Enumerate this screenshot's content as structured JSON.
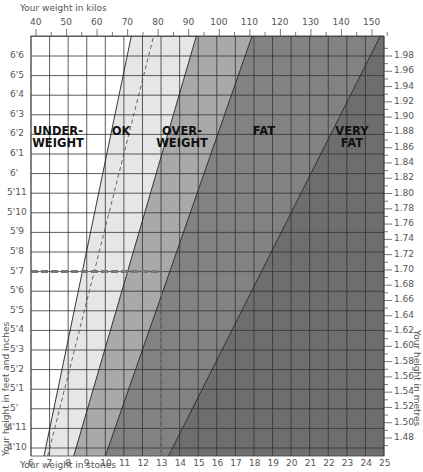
{
  "chart_data": {
    "type": "area",
    "top_axis_label": "Your weight in kilos",
    "bottom_axis_label": "Your weight in stones",
    "left_axis_label": "Your height in feet and inches",
    "right_axis_label": "Your height in metres",
    "kilo_ticks": [
      "40",
      "50",
      "60",
      "70",
      "80",
      "90",
      "100",
      "110",
      "120",
      "130",
      "140",
      "150"
    ],
    "stone_ticks": [
      "6",
      "7",
      "8",
      "9",
      "10",
      "11",
      "12",
      "13",
      "14",
      "15",
      "16",
      "17",
      "18",
      "19",
      "20",
      "21",
      "22",
      "23",
      "24",
      "25"
    ],
    "feet_inch_ticks": [
      "6'6",
      "6'5",
      "6'4",
      "6'3",
      "6'2",
      "6'1",
      "6'",
      "5'11",
      "5'10",
      "5'9",
      "5'8",
      "5'7",
      "5'6",
      "5'5",
      "5'4",
      "5'3",
      "5'2",
      "5'1",
      "5'",
      "4'11",
      "4'10"
    ],
    "metre_ticks": [
      "1.98",
      "1.96",
      "1.94",
      "1.92",
      "1.90",
      "1.88",
      "1.86",
      "1.84",
      "1.82",
      "1.80",
      "1.78",
      "1.76",
      "1.74",
      "1.72",
      "1.70",
      "1.68",
      "1.66",
      "1.64",
      "1.62",
      "1.60",
      "1.58",
      "1.56",
      "1.54",
      "1.52",
      "1.50",
      "1.48"
    ],
    "x_range_stones": [
      6,
      25
    ],
    "y_range_height": [
      "4'10",
      "6'7"
    ],
    "grid": true,
    "bands": [
      {
        "name": "UNDER-WEIGHT",
        "label_lines": [
          "UNDER-",
          "WEIGHT"
        ],
        "color": "#ffffff",
        "boundary_stones_at_4ft10": 6.7,
        "boundary_stones_at_top": 11.4
      },
      {
        "name": "OK",
        "label_lines": [
          "OK"
        ],
        "color": "#e6e6e6",
        "boundary_stones_at_4ft10": 8.3,
        "boundary_stones_at_top": 14.9
      },
      {
        "name": "OVER-WEIGHT",
        "label_lines": [
          "OVER-",
          "WEIGHT"
        ],
        "color": "#a9a9a9",
        "boundary_stones_at_4ft10": 10.0,
        "boundary_stones_at_top": 17.9
      },
      {
        "name": "FAT",
        "label_lines": [
          "FAT"
        ],
        "color": "#828282",
        "boundary_stones_at_4ft10": 13.4,
        "boundary_stones_at_top": 24.8
      },
      {
        "name": "VERY FAT",
        "label_lines": [
          "VERY",
          "FAT"
        ],
        "color": "#6e6e6e"
      }
    ],
    "dashed_line": {
      "description": "ideal weight line within OK band",
      "stones_at_4ft10": 6.9,
      "stones_at_top": 12.6
    },
    "example_reading": {
      "height": "5'7",
      "height_m": 1.7,
      "weight_stones": 13,
      "note": "dashed marker from 5'7 across to 13 stones"
    }
  }
}
